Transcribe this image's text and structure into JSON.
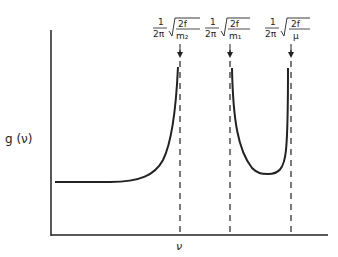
{
  "diagram": {
    "ylabel": "g (ν)",
    "xlabel": "ν",
    "markers": [
      {
        "frac_num": "1",
        "frac_den": "2π",
        "sqrt_num": "2f",
        "sqrt_den": "m₂",
        "x": 180
      },
      {
        "frac_num": "1",
        "frac_den": "2π",
        "sqrt_num": "2f",
        "sqrt_den": "m₁",
        "x": 230
      },
      {
        "frac_num": "1",
        "frac_den": "2π",
        "sqrt_num": "2f",
        "sqrt_den": "μ",
        "x": 291
      }
    ],
    "colors": {
      "ink": "#222222",
      "background": "#ffffff"
    }
  }
}
